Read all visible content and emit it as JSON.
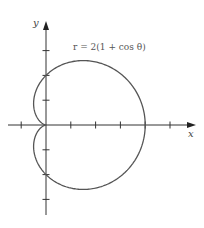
{
  "chart_data": {
    "type": "line",
    "subtype": "polar-curve",
    "title": "",
    "equation": "r = 2(1 + cos θ)",
    "xlabel": "x",
    "ylabel": "y",
    "xlim": [
      -1.5,
      5.9
    ],
    "ylim": [
      -3.6,
      4.2
    ],
    "x_ticks": [
      -1,
      1,
      2,
      3,
      4,
      5
    ],
    "y_ticks": [
      -3,
      -2,
      -1,
      1,
      2,
      3
    ],
    "tick_labels_shown": false,
    "grid": false,
    "series": [
      {
        "name": "cardioid",
        "polar": {
          "a": 2,
          "formula": "r = a(1 + cos θ)",
          "theta_range": [
            0,
            6.283185
          ]
        },
        "key_points": [
          {
            "theta": "0",
            "x": 4,
            "y": 0
          },
          {
            "theta": "π/2",
            "x": 0,
            "y": 2
          },
          {
            "theta": "π",
            "x": 0,
            "y": 0
          },
          {
            "theta": "3π/2",
            "x": 0,
            "y": -2
          }
        ],
        "color": "#555555"
      }
    ]
  },
  "layout": {
    "origin_px": [
      46,
      125
    ],
    "unit_px": 24.8,
    "x_axis_px": [
      8,
      196
    ],
    "y_axis_px": [
      21,
      215
    ],
    "equation_pos_px": [
      73,
      50
    ],
    "xlabel_pos_px": [
      188,
      137
    ],
    "ylabel_pos_px": [
      33,
      26
    ]
  },
  "labels": {
    "equation": "r = 2(1 + cos θ)",
    "x": "x",
    "y": "y"
  }
}
